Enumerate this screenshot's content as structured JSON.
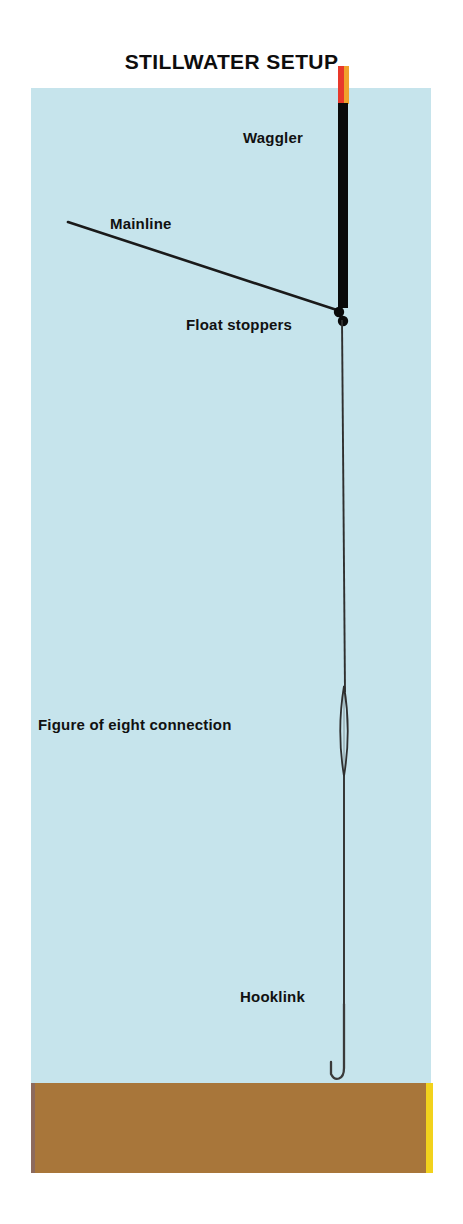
{
  "diagram": {
    "title": "STILLWATER SETUP",
    "type": "fishing-rig-schematic",
    "canvas": {
      "width": 463,
      "height": 1224,
      "background": "#ffffff"
    },
    "scene": {
      "water": {
        "name": "stillwater",
        "color": "#c6e4ec",
        "x": 31,
        "y": 88,
        "width": 400,
        "height": 995
      },
      "lakebed": {
        "name": "lake-bed",
        "color": "#a8763a",
        "edge_right_color": "#f2d21c",
        "edge_left_color": "#8d6a5c",
        "x": 31,
        "y": 1083,
        "width": 400,
        "height": 90
      }
    },
    "labels": {
      "waggler": "Waggler",
      "mainline": "Mainline",
      "float_stoppers": "Float  stoppers",
      "figure_of_eight": "Figure of eight connection",
      "hooklink": "Hooklink"
    },
    "components": {
      "float": {
        "name": "waggler-float",
        "tip_red_color": "#e8392b",
        "tip_orange_color": "#f0a22c",
        "body_color": "#0a0a0a",
        "tip_top_y": 66,
        "body_top_y": 103,
        "body_bottom_y": 308,
        "x": 338,
        "width": 10
      },
      "mainline": {
        "name": "mainline",
        "color": "#1a1a1a",
        "from": {
          "x": 68,
          "y": 222
        },
        "to": {
          "x": 340,
          "y": 311
        }
      },
      "float_stoppers": {
        "name": "float-stoppers",
        "color": "#0a0a0a",
        "count": 2,
        "dots": [
          {
            "x": 339,
            "y": 312,
            "r": 5
          },
          {
            "x": 343,
            "y": 321,
            "r": 5
          }
        ]
      },
      "descending_line": {
        "name": "descending-mainline",
        "color": "#2a2a2a",
        "from": {
          "x": 342,
          "y": 318
        },
        "to": {
          "x": 345,
          "y": 690
        }
      },
      "figure_of_eight": {
        "name": "figure-of-eight-connection",
        "color": "#2a2a2a",
        "shape": "elongated-loop",
        "center_x": 344,
        "top_y": 686,
        "bottom_y": 776,
        "max_width": 9
      },
      "hooklink": {
        "name": "hooklink",
        "color": "#2a2a2a",
        "from": {
          "x": 344,
          "y": 772
        },
        "to": {
          "x": 344,
          "y": 1062
        }
      },
      "hook": {
        "name": "fishing-hook",
        "color": "#3a3a3a",
        "shank_x": 344,
        "shank_top_y": 1000,
        "bend_bottom_y": 1080,
        "point_x": 331,
        "point_top_y": 1062
      }
    }
  }
}
